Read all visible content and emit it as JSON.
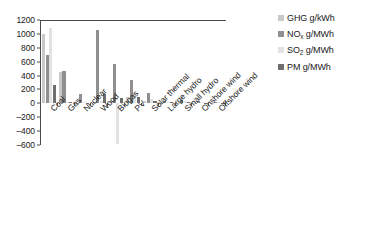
{
  "chart_data": {
    "type": "bar",
    "title": "",
    "xlabel": "",
    "ylabel": "",
    "ylim": [
      -600,
      1200
    ],
    "ytick_step": 200,
    "grid": false,
    "legend_position": "right",
    "yticks": [
      "1200",
      "1000",
      "800",
      "600",
      "400",
      "200",
      "0",
      "-200",
      "-400",
      "-600"
    ],
    "categories": [
      "Coal",
      "Gas",
      "Nuclear",
      "Wood",
      "Biogas",
      "PV",
      "Solar thermal",
      "Large hydro",
      "Small hydro",
      "Onshore wind",
      "Offshore wind"
    ],
    "series": [
      {
        "name": "GHG g/kWh",
        "color": "#c9c9c9",
        "values": [
          1000,
          450,
          10,
          25,
          15,
          90,
          35,
          10,
          12,
          12,
          12
        ]
      },
      {
        "name": "NOₓ g/MWh",
        "color": "#8f8f8f",
        "values": [
          700,
          460,
          130,
          1060,
          570,
          340,
          150,
          40,
          50,
          30,
          25
        ]
      },
      {
        "name": "SO₂ g/MWh",
        "color": "#e2e2e2",
        "values": [
          1090,
          20,
          25,
          30,
          -590,
          150,
          60,
          25,
          30,
          20,
          18
        ]
      },
      {
        "name": "PM g/MWh",
        "color": "#6e6e6e",
        "values": [
          260,
          20,
          10,
          130,
          80,
          90,
          30,
          15,
          18,
          10,
          8
        ]
      }
    ]
  },
  "legend": {
    "items": [
      {
        "label_main": "GHG",
        "label_sub": "",
        "label_tail": " g/kWh"
      },
      {
        "label_main": "NO",
        "label_sub": "x",
        "label_tail": " g/MWh"
      },
      {
        "label_main": "SO",
        "label_sub": "2",
        "label_tail": " g/MWh"
      },
      {
        "label_main": "PM",
        "label_sub": "",
        "label_tail": " g/MWh"
      }
    ]
  }
}
